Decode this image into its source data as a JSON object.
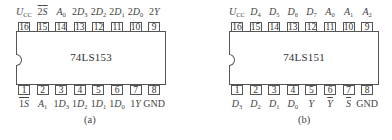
{
  "diagrams": [
    {
      "id": "a",
      "chip_name": "74LS153",
      "caption": "(a)",
      "top_pins": [
        {
          "num": "16",
          "label": "U",
          "sub": "CC",
          "overline": false
        },
        {
          "num": "15",
          "label": "2S",
          "sub": "",
          "overline": true
        },
        {
          "num": "14",
          "label": "A",
          "sub": "0",
          "overline": false
        },
        {
          "num": "13",
          "label": "2D",
          "sub": "3",
          "overline": false
        },
        {
          "num": "12",
          "label": "2D",
          "sub": "2",
          "overline": false
        },
        {
          "num": "11",
          "label": "2D",
          "sub": "1",
          "overline": false
        },
        {
          "num": "10",
          "label": "2D",
          "sub": "0",
          "overline": false
        },
        {
          "num": "9",
          "label": "2Y",
          "sub": "",
          "overline": false
        }
      ],
      "bottom_pins": [
        {
          "num": "1",
          "label": "1S",
          "sub": "",
          "overline": true
        },
        {
          "num": "2",
          "label": "A",
          "sub": "1",
          "overline": false
        },
        {
          "num": "3",
          "label": "1D",
          "sub": "3",
          "overline": false
        },
        {
          "num": "4",
          "label": "1D",
          "sub": "2",
          "overline": false
        },
        {
          "num": "5",
          "label": "1D",
          "sub": "1",
          "overline": false
        },
        {
          "num": "6",
          "label": "1D",
          "sub": "0",
          "overline": false
        },
        {
          "num": "7",
          "label": "1Y",
          "sub": "",
          "overline": false
        },
        {
          "num": "8",
          "label": "GND",
          "sub": "",
          "overline": false
        }
      ]
    },
    {
      "id": "b",
      "chip_name": "74LS151",
      "caption": "(b)",
      "top_pins": [
        {
          "num": "16",
          "label": "U",
          "sub": "CC",
          "overline": false
        },
        {
          "num": "15",
          "label": "D",
          "sub": "4",
          "overline": false
        },
        {
          "num": "14",
          "label": "D",
          "sub": "5",
          "overline": false
        },
        {
          "num": "13",
          "label": "D",
          "sub": "6",
          "overline": false
        },
        {
          "num": "12",
          "label": "D",
          "sub": "7",
          "overline": false
        },
        {
          "num": "11",
          "label": "A",
          "sub": "0",
          "overline": false
        },
        {
          "num": "10",
          "label": "A",
          "sub": "1",
          "overline": false
        },
        {
          "num": "9",
          "label": "A",
          "sub": "2",
          "overline": false
        }
      ],
      "bottom_pins": [
        {
          "num": "1",
          "label": "D",
          "sub": "3",
          "overline": false
        },
        {
          "num": "2",
          "label": "D",
          "sub": "2",
          "overline": false
        },
        {
          "num": "3",
          "label": "D",
          "sub": "1",
          "overline": false
        },
        {
          "num": "4",
          "label": "D",
          "sub": "0",
          "overline": false
        },
        {
          "num": "5",
          "label": "Y",
          "sub": "",
          "overline": false
        },
        {
          "num": "6",
          "label": "Y",
          "sub": "",
          "overline": true
        },
        {
          "num": "7",
          "label": "S",
          "sub": "",
          "overline": true
        },
        {
          "num": "8",
          "label": "GND",
          "sub": "",
          "overline": false
        }
      ]
    }
  ]
}
